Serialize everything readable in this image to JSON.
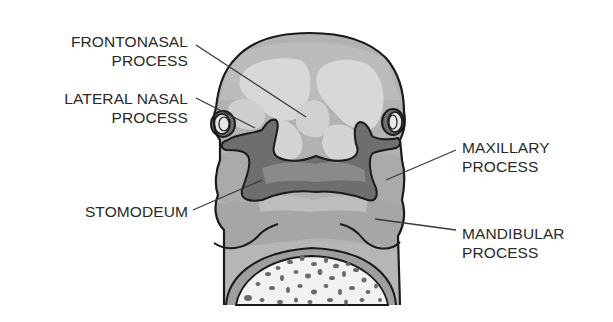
{
  "diagram": {
    "colors": {
      "outline": "#1a1a1a",
      "skin_base": "#b4b4b4",
      "light_region": "#d6d6d6",
      "mid_region": "#a8a8a8",
      "stomodeum": "#6e6e6e",
      "stomodeum_inner": "#8c8c8c",
      "mandibular": "#a0a0a0",
      "leader_line": "#3a3a3a",
      "label_text": "#2a2a2a",
      "speckle": "#6a6a6a",
      "background": "#ffffff"
    },
    "labels": [
      {
        "id": "frontonasal",
        "line1": "FRONTONASAL",
        "line2": "PROCESS",
        "side": "left"
      },
      {
        "id": "lateral-nasal",
        "line1": "LATERAL NASAL",
        "line2": "PROCESS",
        "side": "left"
      },
      {
        "id": "stomodeum",
        "line1": "STOMODEUM",
        "line2": "",
        "side": "left"
      },
      {
        "id": "maxillary",
        "line1": "MAXILLARY",
        "line2": "PROCESS",
        "side": "right"
      },
      {
        "id": "mandibular",
        "line1": "MANDIBULAR",
        "line2": "PROCESS",
        "side": "right"
      }
    ]
  }
}
